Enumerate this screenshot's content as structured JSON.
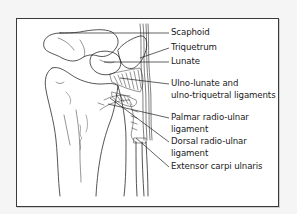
{
  "figure": {
    "labels": [
      {
        "id": "scaphoid",
        "text": "Scaphoid"
      },
      {
        "id": "triquetrum",
        "text": "Triquetrum"
      },
      {
        "id": "lunate",
        "text": "Lunate"
      },
      {
        "id": "ulno-lunate",
        "text": "Ulno-lunate and",
        "text2": "ulno-triquetral ligaments"
      },
      {
        "id": "palmar-radio-ulnar",
        "text": "Palmar radio-ulnar",
        "text2": "ligament"
      },
      {
        "id": "dorsal-radio-ulnar",
        "text": "Dorsal radio-ulnar",
        "text2": "ligament"
      },
      {
        "id": "extensor-carpi-ulnaris",
        "text": "Extensor carpi ulnaris"
      }
    ]
  },
  "colors": {
    "line": "#2a2a2a",
    "frame_border": "#3a3a3a",
    "background": "#ffffff",
    "page": "#f5f5f5"
  }
}
